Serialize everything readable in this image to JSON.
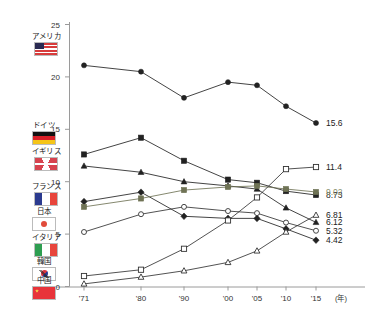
{
  "chart_data": {
    "type": "line",
    "title": "",
    "xlabel": "(年)",
    "ylabel": "",
    "x": [
      "'71",
      "'80",
      "'90",
      "'00",
      "'05",
      "'10",
      "'15"
    ],
    "ylim": [
      0,
      25
    ],
    "yticks": [
      0,
      5,
      10,
      15,
      20,
      25
    ],
    "grid": false,
    "legend_position": "left-inside",
    "series": [
      {
        "name": "アメリカ",
        "marker": "filled-circle",
        "color": "#222222",
        "end_label": "15.6",
        "end_label_color": "#222222",
        "values": [
          21.1,
          20.5,
          18.0,
          19.5,
          19.2,
          17.2,
          15.6
        ]
      },
      {
        "name": "ドイツ",
        "marker": "filled-square",
        "color": "#222222",
        "end_label": "8.73",
        "end_label_color": "#222222",
        "values": [
          12.6,
          14.2,
          12.0,
          10.2,
          9.9,
          9.1,
          8.73
        ]
      },
      {
        "name": "イギリス",
        "marker": "filled-triangle",
        "color": "#222222",
        "end_label": "6.12",
        "end_label_color": "#222222",
        "values": [
          11.5,
          10.9,
          10.0,
          9.6,
          9.3,
          7.5,
          6.12
        ]
      },
      {
        "name": "フランス",
        "marker": "filled-diamond",
        "color": "#222222",
        "end_label": "4.42",
        "end_label_color": "#222222",
        "values": [
          8.1,
          9.0,
          6.7,
          6.5,
          6.5,
          5.5,
          4.42
        ]
      },
      {
        "name": "日本",
        "marker": "filled-square-olive",
        "color": "#6f7355",
        "end_label": "9.02",
        "end_label_color": "#8a8f6b",
        "values": [
          7.6,
          8.4,
          9.2,
          9.5,
          9.6,
          9.3,
          9.02
        ]
      },
      {
        "name": "イタリア",
        "marker": "open-circle",
        "color": "#333333",
        "end_label": "5.32",
        "end_label_color": "#222222",
        "values": [
          5.2,
          6.9,
          7.6,
          7.2,
          7.0,
          6.1,
          5.32
        ]
      },
      {
        "name": "韓国",
        "marker": "open-square",
        "color": "#333333",
        "end_label": "11.4",
        "end_label_color": "#222222",
        "values": [
          1.0,
          1.6,
          3.6,
          6.3,
          8.5,
          11.2,
          11.4
        ]
      },
      {
        "name": "中国",
        "marker": "open-triangle",
        "color": "#333333",
        "end_label": "6.81",
        "end_label_color": "#222222",
        "values": [
          0.25,
          0.9,
          1.5,
          2.3,
          3.4,
          5.2,
          6.81
        ]
      }
    ]
  },
  "legend": {
    "items": [
      {
        "label": "アメリカ",
        "flag": "flag-us",
        "flag_name": "flag-united-states"
      },
      {
        "label": "ドイツ",
        "flag": "flag-de",
        "flag_name": "flag-germany"
      },
      {
        "label": "イギリス",
        "flag": "flag-gb",
        "flag_name": "flag-united-kingdom"
      },
      {
        "label": "フランス",
        "flag": "flag-fr",
        "flag_name": "flag-france"
      },
      {
        "label": "日本",
        "flag": "flag-jp",
        "flag_name": "flag-japan"
      },
      {
        "label": "イタリア",
        "flag": "flag-it",
        "flag_name": "flag-italy"
      },
      {
        "label": "韓国",
        "flag": "flag-kr",
        "flag_name": "flag-south-korea"
      },
      {
        "label": "中国",
        "flag": "flag-cn",
        "flag_name": "flag-china"
      }
    ]
  }
}
